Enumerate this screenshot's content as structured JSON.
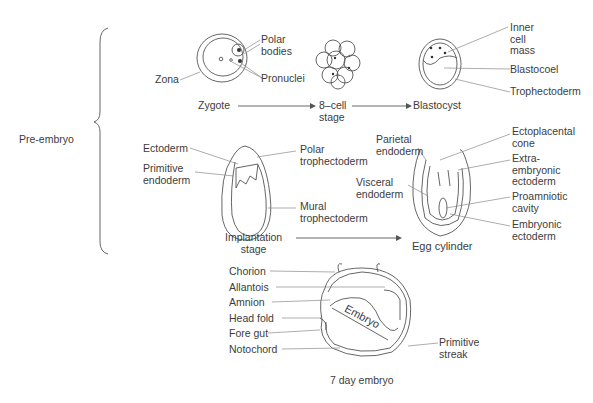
{
  "diagram": {
    "group_label": "Pre-embryo",
    "stages": {
      "zygote": {
        "name": "Zygote",
        "labels": {
          "zona": "Zona",
          "polar_bodies": "Polar\nbodies",
          "pronuclei": "Pronuclei"
        }
      },
      "eight_cell": {
        "name": "8–cell\nstage"
      },
      "blastocyst": {
        "name": "Blastocyst",
        "labels": {
          "inner_cell_mass": "Inner\ncell\nmass",
          "blastocoel": "Blastocoel",
          "trophectoderm": "Trophectoderm"
        }
      },
      "implantation": {
        "name": "Implantation\nstage",
        "labels": {
          "ectoderm": "Ectoderm",
          "primitive_endoderm": "Primitive\nendoderm",
          "polar_trophectoderm": "Polar\ntrophectoderm",
          "mural_trophectoderm": "Mural\ntrophectoderm"
        }
      },
      "egg_cylinder": {
        "name": "Egg cylinder",
        "labels": {
          "parietal_endoderm": "Parietal\nendoderm",
          "visceral_endoderm": "Visceral\nendoderm",
          "ectoplacental_cone": "Ectoplacental\ncone",
          "extraembryonic_ectoderm": "Extra-\nembryonic\nectoderm",
          "proamniotic_cavity": "Proamniotic\ncavity",
          "embryonic_ectoderm": "Embryonic\nectoderm"
        }
      },
      "day7_embryo": {
        "name": "7 day embryo",
        "labels": {
          "chorion": "Chorion",
          "allantois": "Allantois",
          "amnion": "Amnion",
          "head_fold": "Head fold",
          "fore_gut": "Fore gut",
          "notochord": "Notochord",
          "embryo": "Embryo",
          "primitive_streak": "Primitive\nstreak"
        }
      }
    }
  }
}
